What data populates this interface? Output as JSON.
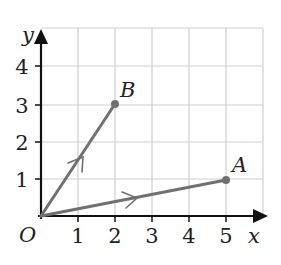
{
  "diagram": {
    "type": "vector-diagram",
    "axes": {
      "x_label": "x",
      "y_label": "y",
      "origin_label": "O",
      "x_ticks": [
        "1",
        "2",
        "3",
        "4",
        "5"
      ],
      "y_ticks": [
        "1",
        "2",
        "3",
        "4"
      ]
    },
    "points": [
      {
        "label": "A",
        "x": 5,
        "y": 1
      },
      {
        "label": "B",
        "x": 2,
        "y": 3
      }
    ],
    "vectors": [
      {
        "name": "OA",
        "from": "O",
        "to": "A"
      },
      {
        "name": "OB",
        "from": "O",
        "to": "B"
      }
    ],
    "grid": {
      "x_max": 6,
      "y_max": 5
    }
  },
  "colors": {
    "axis": "#111111",
    "grid": "#cccccc",
    "vector": "#707070"
  }
}
